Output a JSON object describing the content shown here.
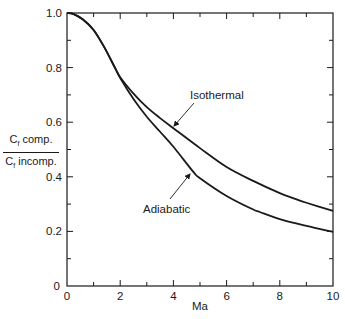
{
  "chart_data": {
    "type": "line",
    "title": "",
    "xlabel": "Ma",
    "ylabel": {
      "numerator": "Cf comp.",
      "denominator": "Cf incomp."
    },
    "xlim": [
      0,
      10
    ],
    "ylim": [
      0,
      1.0
    ],
    "x_ticks": [
      "0",
      "2",
      "4",
      "6",
      "8",
      "10"
    ],
    "x_minor_step": 1,
    "y_ticks": [
      "0",
      "0.2",
      "0.4",
      "0.6",
      "0.8",
      "1.0"
    ],
    "y_minor_step": 0.1,
    "grid": false,
    "legend": "none (inline annotations with arrows)",
    "series": [
      {
        "name": "Isothermal",
        "x": [
          0,
          0.25,
          0.6,
          1.0,
          1.4,
          1.8,
          2.0,
          2.5,
          3.0,
          3.5,
          4.0,
          5.0,
          6.0,
          7.0,
          8.0,
          8.5,
          9.0,
          10.0
        ],
        "y": [
          1.0,
          0.996,
          0.976,
          0.938,
          0.875,
          0.8,
          0.765,
          0.705,
          0.655,
          0.615,
          0.578,
          0.505,
          0.436,
          0.385,
          0.34,
          0.322,
          0.305,
          0.275
        ]
      },
      {
        "name": "Adiabatic",
        "x": [
          0,
          0.25,
          0.6,
          1.0,
          1.4,
          1.8,
          2.0,
          2.5,
          3.0,
          3.5,
          4.0,
          4.75,
          5.0,
          6.0,
          7.0,
          7.25,
          8.0,
          9.0,
          10.0
        ],
        "y": [
          1.0,
          0.996,
          0.976,
          0.938,
          0.875,
          0.8,
          0.762,
          0.685,
          0.62,
          0.565,
          0.51,
          0.418,
          0.395,
          0.33,
          0.28,
          0.271,
          0.245,
          0.22,
          0.198
        ]
      }
    ],
    "annotations": [
      {
        "text": "Isothermal",
        "target_series": "Isothermal",
        "target_x": 3.9
      },
      {
        "text": "Adiabatic",
        "target_series": "Adiabatic",
        "target_x": 4.75
      }
    ]
  },
  "labels": {
    "xlabel": "Ma",
    "y_num": "C",
    "y_num_sub": "f",
    "y_num_rest": " comp.",
    "y_den": "C",
    "y_den_sub": "f",
    "y_den_rest": " incomp.",
    "isothermal": "Isothermal",
    "adiabatic": "Adiabatic"
  },
  "colors": {
    "ink": "#1a1a1a",
    "background": "#ffffff"
  }
}
